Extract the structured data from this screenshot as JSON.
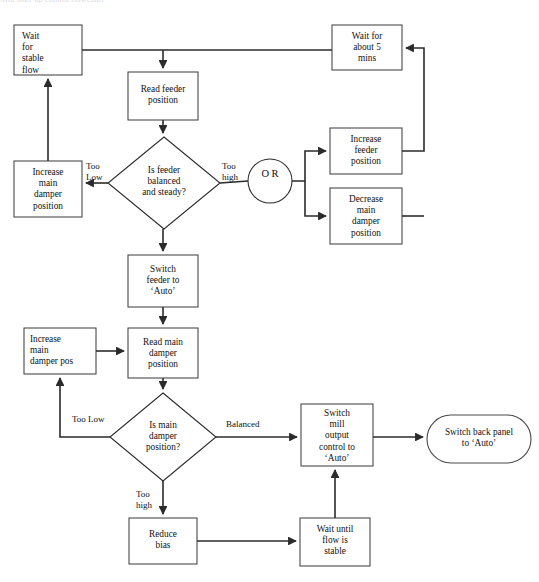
{
  "diagram": {
    "title": "Mill start-up control flowchart",
    "type": "flowchart",
    "colors": {
      "stroke": "#2b2b2b",
      "box_fill": "#ffffff",
      "text": "#111111",
      "background": "#ffffff"
    },
    "nodes": [
      {
        "id": "wait_stable_flow",
        "shape": "rect",
        "label": "Wait\nfor\nstable\nflow",
        "align": "left",
        "x": 14,
        "y": 25,
        "w": 68,
        "h": 50
      },
      {
        "id": "wait_5_mins",
        "shape": "rect",
        "label": "Wait for\nabout 5\nmins",
        "align": "center",
        "x": 332,
        "y": 25,
        "w": 70,
        "h": 45
      },
      {
        "id": "read_feeder",
        "shape": "rect",
        "label": "Read feeder\nposition",
        "align": "center",
        "x": 128,
        "y": 72,
        "w": 70,
        "h": 48
      },
      {
        "id": "increase_main_damper_position",
        "shape": "rect",
        "label": "Increase\nmain\ndamper\nposition",
        "align": "center",
        "x": 14,
        "y": 161,
        "w": 68,
        "h": 56
      },
      {
        "id": "is_feeder_balanced",
        "shape": "diamond",
        "label": "Is feeder\nbalanced\nand steady?",
        "align": "center",
        "x": 108,
        "y": 137,
        "w": 112,
        "h": 92
      },
      {
        "id": "or_junction",
        "shape": "circle",
        "label": "O\nR",
        "align": "center",
        "x": 248,
        "y": 159,
        "w": 44,
        "h": 44
      },
      {
        "id": "increase_feeder",
        "shape": "rect",
        "label": "Increase\nfeeder\nposition",
        "align": "center",
        "x": 330,
        "y": 128,
        "w": 72,
        "h": 46
      },
      {
        "id": "decrease_main_damper",
        "shape": "rect",
        "label": "Decrease\nmain\ndamper\nposition",
        "align": "center",
        "x": 330,
        "y": 188,
        "w": 72,
        "h": 56
      },
      {
        "id": "switch_feeder_auto",
        "shape": "rect",
        "label": "Switch\nfeeder to\n‘Auto’",
        "align": "center",
        "x": 128,
        "y": 255,
        "w": 70,
        "h": 52
      },
      {
        "id": "increase_main_damper_pos",
        "shape": "rect",
        "label": "Increase\nmain\ndamper pos",
        "align": "left",
        "x": 24,
        "y": 328,
        "w": 72,
        "h": 46
      },
      {
        "id": "read_main_damper",
        "shape": "rect",
        "label": "Read main\ndamper\nposition",
        "align": "center",
        "x": 128,
        "y": 328,
        "w": 70,
        "h": 50
      },
      {
        "id": "is_main_damper_pos",
        "shape": "diamond",
        "label": "Is main\ndamper\nposition?",
        "align": "center",
        "x": 110,
        "y": 393,
        "w": 106,
        "h": 88
      },
      {
        "id": "switch_mill_output",
        "shape": "rect",
        "label": "Switch\nmill\noutput\ncontrol to\n‘Auto’",
        "align": "center",
        "x": 301,
        "y": 404,
        "w": 72,
        "h": 62
      },
      {
        "id": "switch_back_panel",
        "shape": "terminator",
        "label": "Switch back panel\nto ‘Auto’",
        "align": "center",
        "x": 427,
        "y": 415,
        "w": 104,
        "h": 48
      },
      {
        "id": "reduce_bias",
        "shape": "rect",
        "label": "Reduce\nbias",
        "align": "center",
        "x": 129,
        "y": 518,
        "w": 68,
        "h": 46
      },
      {
        "id": "wait_until_flow_stable",
        "shape": "rect",
        "label": "Wait until\nflow is\nstable",
        "align": "center",
        "x": 300,
        "y": 518,
        "w": 70,
        "h": 48
      }
    ],
    "edge_labels": [
      {
        "id": "too_low_feeder",
        "text": "Too\nLow",
        "x": 86,
        "y": 160,
        "align": "left"
      },
      {
        "id": "too_high_feeder",
        "text": "Too\nhigh",
        "x": 222,
        "y": 160,
        "align": "left"
      },
      {
        "id": "too_low_damper",
        "text": "Too Low",
        "x": 72,
        "y": 414,
        "align": "left"
      },
      {
        "id": "balanced_damper",
        "text": "Balanced",
        "x": 226,
        "y": 419,
        "align": "left"
      },
      {
        "id": "too_high_damper",
        "text": "Too\nhigh",
        "x": 136,
        "y": 489,
        "align": "left"
      }
    ],
    "edges": [
      {
        "from": "increase_main_damper_position",
        "to": "wait_stable_flow",
        "label": ""
      },
      {
        "from": "wait_stable_flow",
        "to": "wait_5_mins",
        "label": ""
      },
      {
        "from": "wait_stable_flow",
        "to": "read_feeder",
        "label": ""
      },
      {
        "from": "read_feeder",
        "to": "is_feeder_balanced",
        "label": ""
      },
      {
        "from": "is_feeder_balanced",
        "to": "increase_main_damper_position",
        "label": "Too Low"
      },
      {
        "from": "is_feeder_balanced",
        "to": "or_junction",
        "label": "Too high"
      },
      {
        "from": "or_junction",
        "to": "increase_feeder",
        "label": ""
      },
      {
        "from": "or_junction",
        "to": "decrease_main_damper",
        "label": ""
      },
      {
        "from": "increase_feeder",
        "to": "wait_5_mins",
        "label": ""
      },
      {
        "from": "decrease_main_damper",
        "to": "wait_5_mins",
        "label": ""
      },
      {
        "from": "is_feeder_balanced",
        "to": "switch_feeder_auto",
        "label": ""
      },
      {
        "from": "switch_feeder_auto",
        "to": "read_main_damper",
        "label": ""
      },
      {
        "from": "increase_main_damper_pos",
        "to": "read_main_damper",
        "label": ""
      },
      {
        "from": "read_main_damper",
        "to": "is_main_damper_pos",
        "label": ""
      },
      {
        "from": "is_main_damper_pos",
        "to": "increase_main_damper_pos",
        "label": "Too Low"
      },
      {
        "from": "is_main_damper_pos",
        "to": "switch_mill_output",
        "label": "Balanced"
      },
      {
        "from": "is_main_damper_pos",
        "to": "reduce_bias",
        "label": "Too high"
      },
      {
        "from": "switch_mill_output",
        "to": "switch_back_panel",
        "label": ""
      },
      {
        "from": "reduce_bias",
        "to": "wait_until_flow_stable",
        "label": ""
      },
      {
        "from": "wait_until_flow_stable",
        "to": "switch_mill_output",
        "label": ""
      }
    ]
  }
}
